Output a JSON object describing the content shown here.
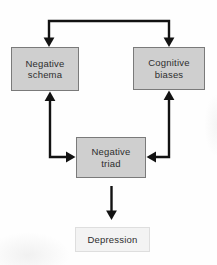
{
  "diagram_type": "flowchart",
  "nodes": {
    "negative_schema": {
      "label": "Negative\nschema"
    },
    "cognitive_biases": {
      "label": "Cognitive\nbiases"
    },
    "negative_triad": {
      "label": "Negative\ntriad"
    },
    "depression": {
      "label": "Depression"
    }
  },
  "edges": [
    {
      "from": "negative_schema",
      "to": "cognitive_biases",
      "type": "double-headed",
      "route": "over-the-top bracket, arrowheads point down into the top of both boxes"
    },
    {
      "from": "negative_schema",
      "to": "negative_triad",
      "type": "double-headed",
      "route": "elbow: up-arrow into bottom of Negative schema, right-arrow into left side of Negative triad"
    },
    {
      "from": "cognitive_biases",
      "to": "negative_triad",
      "type": "double-headed",
      "route": "elbow: up-arrow into bottom of Cognitive biases, left-arrow into right side of Negative triad"
    },
    {
      "from": "negative_triad",
      "to": "depression",
      "type": "single-headed",
      "route": "straight vertical arrow pointing down"
    }
  ],
  "colors": {
    "background": "#fefefe",
    "node_fill": "#cfcfcf",
    "node_border": "#7a7a7a",
    "light_node_fill": "#f3f3f3",
    "light_node_border": "#dedede",
    "arrow": "#121212",
    "text": "#2e2e2e"
  }
}
